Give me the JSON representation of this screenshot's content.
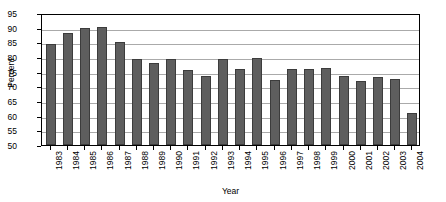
{
  "chart_data": {
    "type": "bar",
    "title": "",
    "xlabel": "Year",
    "ylabel": "Percent",
    "ylim": [
      50,
      95
    ],
    "ytick_step": 5,
    "yticks": [
      50,
      55,
      60,
      65,
      70,
      75,
      80,
      85,
      90,
      95
    ],
    "grid": true,
    "legend": null,
    "bar_color": "#5e5e5e",
    "bar_edge_color": "#3c3c3c",
    "background_color": "#ffffff",
    "grid_color": "#aaaaaa",
    "axis_color": "#000000",
    "categories": [
      "1983",
      "1984",
      "1985",
      "1986",
      "1987",
      "1988",
      "1989",
      "1990",
      "1991",
      "1992",
      "1993",
      "1994",
      "1995",
      "1996",
      "1997",
      "1998",
      "1999",
      "2000",
      "2001",
      "2002",
      "2003",
      "2004"
    ],
    "values": [
      84.5,
      88.1,
      89.8,
      90.2,
      85.0,
      79.4,
      78.0,
      79.3,
      75.7,
      73.6,
      79.2,
      76.0,
      79.8,
      72.3,
      75.8,
      75.8,
      76.2,
      73.7,
      71.8,
      73.2,
      72.5,
      60.8
    ]
  }
}
